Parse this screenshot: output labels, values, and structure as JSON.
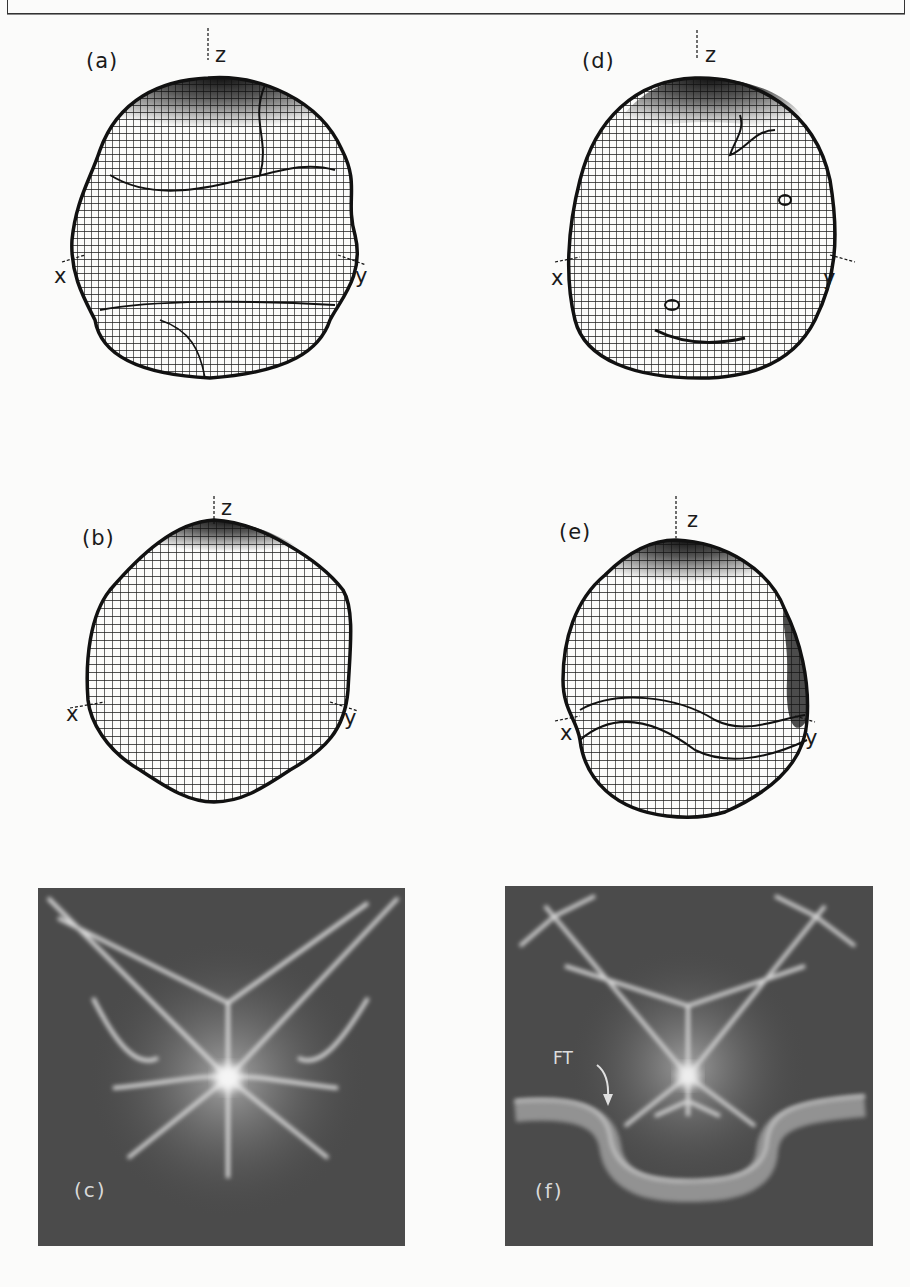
{
  "page": {
    "header_text": "",
    "background_color": "#fbfbfa"
  },
  "figure": {
    "panels": [
      {
        "id": "a",
        "label": "(a)",
        "kind": "wireframe-surface",
        "axes": {
          "x": "x",
          "y": "y",
          "z": "z"
        }
      },
      {
        "id": "b",
        "label": "(b)",
        "kind": "wireframe-surface",
        "axes": {
          "x": "x",
          "y": "y",
          "z": "z"
        }
      },
      {
        "id": "c",
        "label": "(c)",
        "kind": "photograph"
      },
      {
        "id": "d",
        "label": "(d)",
        "kind": "wireframe-surface",
        "axes": {
          "x": "x",
          "y": "y",
          "z": "z"
        }
      },
      {
        "id": "e",
        "label": "(e)",
        "kind": "wireframe-surface",
        "axes": {
          "x": "x",
          "y": "y",
          "z": "z"
        }
      },
      {
        "id": "f",
        "label": "(f)",
        "kind": "photograph",
        "annotation": "FT"
      }
    ],
    "colors": {
      "wire": "#1a1a1a",
      "photo_bg": "#4b4b4b",
      "photo_glow": "#e8e8e8"
    }
  }
}
